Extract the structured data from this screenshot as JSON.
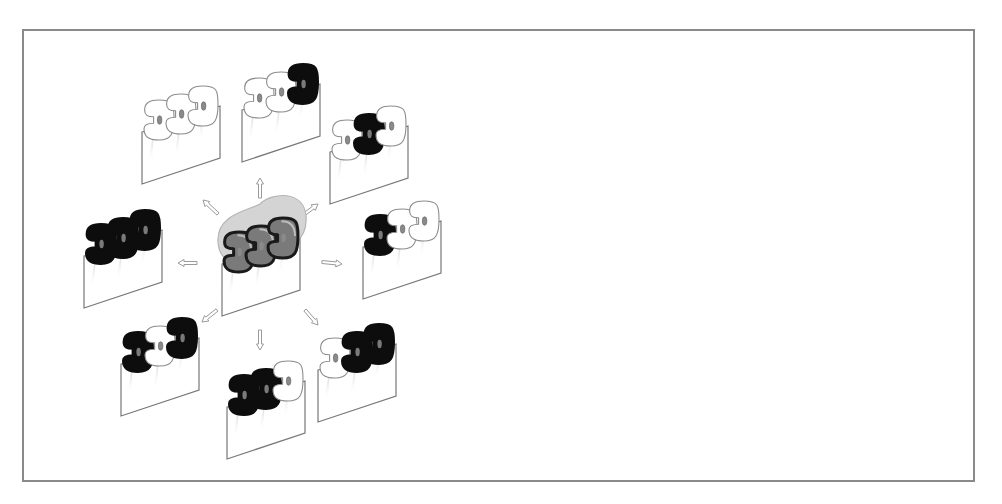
{
  "diagram": {
    "type": "trimer-state-schematic",
    "frame": {
      "x": 22,
      "y": 29,
      "width": 953,
      "height": 453,
      "border_color": "#8a8a8a"
    },
    "colors": {
      "white_subunit_fill": "#ffffff",
      "white_subunit_stroke": "#8c8c8c",
      "black_subunit_fill": "#0d0d0d",
      "center_subunit_fill": "#7a7a7a",
      "center_halo": "#d4d4d4",
      "membrane_stroke": "#777777",
      "arrow_stroke": "#9a9a9a",
      "pore_fill": "#8a8a8a"
    },
    "center": {
      "name": "central-trimer",
      "x": 260,
      "y": 262,
      "subunits": [
        "gray",
        "gray",
        "gray"
      ]
    },
    "units": [
      {
        "name": "unit-north",
        "x": 280,
        "y": 108,
        "subunits": [
          "white",
          "white",
          "black"
        ]
      },
      {
        "name": "unit-north-east",
        "x": 368,
        "y": 150,
        "subunits": [
          "white",
          "black",
          "white"
        ]
      },
      {
        "name": "unit-east",
        "x": 401,
        "y": 245,
        "subunits": [
          "black",
          "white",
          "white"
        ]
      },
      {
        "name": "unit-south-east",
        "x": 356,
        "y": 368,
        "subunits": [
          "white",
          "black",
          "black"
        ]
      },
      {
        "name": "unit-south",
        "x": 265,
        "y": 405,
        "subunits": [
          "black",
          "black",
          "white"
        ]
      },
      {
        "name": "unit-south-west",
        "x": 159,
        "y": 362,
        "subunits": [
          "black",
          "white",
          "black"
        ]
      },
      {
        "name": "unit-west",
        "x": 122,
        "y": 254,
        "subunits": [
          "black",
          "black",
          "black"
        ]
      },
      {
        "name": "unit-north-west",
        "x": 180,
        "y": 130,
        "subunits": [
          "white",
          "white",
          "white"
        ]
      }
    ],
    "arrows": [
      {
        "name": "arrow-north",
        "x1": 260,
        "y1": 198,
        "x2": 260,
        "y2": 178
      },
      {
        "name": "arrow-north-east",
        "x1": 302,
        "y1": 216,
        "x2": 318,
        "y2": 204
      },
      {
        "name": "arrow-east",
        "x1": 322,
        "y1": 262,
        "x2": 342,
        "y2": 264
      },
      {
        "name": "arrow-south-east",
        "x1": 305,
        "y1": 310,
        "x2": 318,
        "y2": 325
      },
      {
        "name": "arrow-south",
        "x1": 260,
        "y1": 330,
        "x2": 260,
        "y2": 350
      },
      {
        "name": "arrow-south-west",
        "x1": 217,
        "y1": 310,
        "x2": 202,
        "y2": 322
      },
      {
        "name": "arrow-west",
        "x1": 197,
        "y1": 263,
        "x2": 178,
        "y2": 263
      },
      {
        "name": "arrow-north-west",
        "x1": 218,
        "y1": 214,
        "x2": 203,
        "y2": 200
      }
    ]
  }
}
